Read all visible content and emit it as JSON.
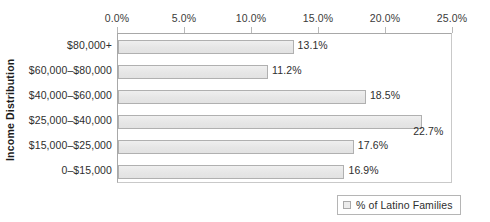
{
  "chart_data": {
    "type": "bar",
    "orientation": "horizontal",
    "title": "",
    "xlabel": "",
    "ylabel": "Income Distribution",
    "categories": [
      "$80,000+",
      "$60,000–$80,000",
      "$40,000–$60,000",
      "$25,000–$40,000",
      "$15,000–$25,000",
      "0–$15,000"
    ],
    "values": [
      13.1,
      11.2,
      18.5,
      22.7,
      17.6,
      16.9
    ],
    "data_labels": [
      "13.1%",
      "11.2%",
      "18.5%",
      "22.7%",
      "17.6%",
      "16.9%"
    ],
    "xlim": [
      0,
      25
    ],
    "xticks": [
      0,
      5,
      10,
      15,
      20,
      25
    ],
    "xtick_labels": [
      "0.0%",
      "5.0%",
      "10.0%",
      "15.0%",
      "20.0%",
      "25.0%"
    ],
    "grid": false,
    "axis_position": "top",
    "legend": {
      "position": "bottom-right",
      "entries": [
        {
          "label": "% of Latino Families",
          "swatch_color": "#ececec"
        }
      ]
    },
    "series": [
      {
        "name": "% of Latino Families",
        "values": [
          13.1,
          11.2,
          18.5,
          22.7,
          17.6,
          16.9
        ]
      }
    ],
    "colors": {
      "bar_fill": "#e9e9e9",
      "bar_border": "#b0b0b0",
      "axis": "#a8a8a8",
      "text": "#2e2e2e",
      "background": "#ffffff"
    }
  }
}
